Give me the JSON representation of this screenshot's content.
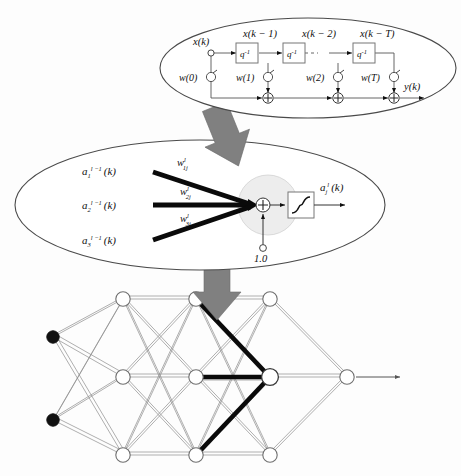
{
  "figure": {
    "background": "#fdfdfd",
    "ink": "#101010",
    "arrow_gray": "#808080",
    "node_gray": "#9a9a9a",
    "halo_gray": "#ededed"
  },
  "tapped_delay_line": {
    "panel_name": "tapped-delay-line-ellipse",
    "input_label": "x(k)",
    "output_label": "y(k)",
    "delay_box_label": "q",
    "delay_box_exponent": "-1",
    "tap_signals": [
      "x(k − 1)",
      "x(k − 2)",
      "x(k − T)"
    ],
    "weights": [
      "w(0)",
      "w(1)",
      "w(2)",
      "w(T)"
    ],
    "sum_symbol": "+",
    "ellipsis": "dashed-connection"
  },
  "neuron_detail": {
    "panel_name": "neuron-detail-ellipse",
    "inputs": [
      {
        "base": "a",
        "sub": "1",
        "sup": "l − 1",
        "arg": "(k)",
        "text": "a₁ˡ⁻¹ (k)"
      },
      {
        "base": "a",
        "sub": "2",
        "sup": "l − 1",
        "arg": "(k)",
        "text": "a₂ˡ⁻¹ (k)"
      },
      {
        "base": "a",
        "sub": "3",
        "sup": "l − 1",
        "arg": "(k)",
        "text": "a₃ˡ⁻¹ (k)"
      }
    ],
    "weights": [
      {
        "base": "w",
        "sub": "1j",
        "sup": "l",
        "text": "w¹ⱼ"
      },
      {
        "base": "w",
        "sub": "2j",
        "sup": "l",
        "text": "w²ⱼ"
      },
      {
        "base": "w",
        "sub": "3j",
        "sup": "l",
        "text": "w³ⱼ"
      }
    ],
    "bias_label": "1.0",
    "sum_symbol": "+",
    "activation": "sigmoid",
    "output": {
      "base": "a",
      "sub": "j",
      "sup": "l",
      "arg": "(k)",
      "text": "aⱼˡ (k)"
    }
  },
  "network": {
    "panel_name": "network-architecture",
    "layers": [
      {
        "name": "input-layer",
        "x": 53,
        "nodes": [
          337,
          420
        ],
        "filled": true
      },
      {
        "name": "hidden-layer-1",
        "x": 123,
        "nodes": [
          299,
          377,
          455
        ],
        "filled": false
      },
      {
        "name": "hidden-layer-2",
        "x": 196,
        "nodes": [
          299,
          377,
          455
        ],
        "filled": false
      },
      {
        "name": "hidden-layer-3",
        "x": 270,
        "nodes": [
          299,
          377,
          455
        ],
        "filled": false
      },
      {
        "name": "output-layer",
        "x": 347,
        "nodes": [
          377
        ],
        "filled": false
      }
    ],
    "highlighted_node": {
      "layer": "hidden-layer-3",
      "x": 270,
      "y": 377
    },
    "highlighted_edges": [
      {
        "from_x": 196,
        "from_y": 299,
        "to_x": 270,
        "to_y": 377
      },
      {
        "from_x": 196,
        "from_y": 377,
        "to_x": 270,
        "to_y": 377
      },
      {
        "from_x": 196,
        "from_y": 455,
        "to_x": 270,
        "to_y": 377
      }
    ],
    "output_arrow": "right-arrow"
  },
  "zoom_arrows": [
    {
      "name": "zoom-arrow-top",
      "from": "neuron-detail",
      "to": "tapped-delay-line",
      "rotation": -22
    },
    {
      "name": "zoom-arrow-bottom",
      "from": "network-node",
      "to": "neuron-detail",
      "rotation": 0
    }
  ]
}
